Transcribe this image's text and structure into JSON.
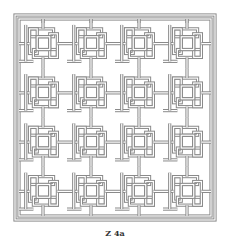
{
  "figure": {
    "caption": "Z 4a",
    "grid_rows": 4,
    "grid_cols": 4,
    "line_color": "#8a8a8a",
    "fill_color": "#ffffff"
  }
}
